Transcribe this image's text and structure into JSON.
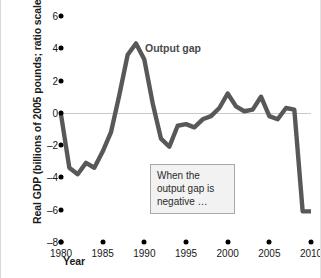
{
  "chart_data": {
    "type": "line",
    "title": "",
    "xlabel": "Year",
    "ylabel": "Real GDP (billions of 2005 pounds; ratio scale)",
    "xlim": [
      1980,
      2010
    ],
    "ylim": [
      -8,
      6
    ],
    "yticks": [
      6,
      4,
      2,
      0,
      -2,
      -4,
      -6,
      -8
    ],
    "ytick_labels": [
      "6",
      "4",
      "2",
      "0",
      "–2",
      "–4",
      "–6",
      "–8"
    ],
    "xticks": [
      1980,
      1985,
      1990,
      1995,
      2000,
      2005,
      2010
    ],
    "xtick_labels": [
      "1980",
      "1985",
      "1990",
      "1995",
      "2000",
      "2005",
      "2010"
    ],
    "grid": false,
    "zero_line": true,
    "legend_position": "inline-annotation",
    "series": [
      {
        "name": "Output gap",
        "color": "#58585a",
        "x": [
          1980,
          1981,
          1982,
          1983,
          1984,
          1985,
          1986,
          1987,
          1988,
          1989,
          1990,
          1991,
          1992,
          1993,
          1994,
          1995,
          1996,
          1997,
          1998,
          1999,
          2000,
          2001,
          2002,
          2003,
          2004,
          2005,
          2006,
          2007,
          2008,
          2009,
          2010
        ],
        "values": [
          -0.1,
          -3.4,
          -3.8,
          -3.1,
          -3.4,
          -2.4,
          -1.2,
          1.1,
          3.6,
          4.3,
          3.3,
          0.6,
          -1.6,
          -2.1,
          -0.8,
          -0.7,
          -0.9,
          -0.4,
          -0.2,
          0.3,
          1.2,
          0.4,
          0.1,
          0.2,
          1.0,
          -0.2,
          -0.4,
          0.3,
          0.2,
          -6.1,
          -6.1
        ]
      }
    ],
    "annotations": [
      {
        "name": "series-label",
        "text": "Output gap"
      },
      {
        "name": "callout",
        "text": "When the output gap is negative …"
      }
    ]
  },
  "axes": {
    "ylabel": "Real GDP (billions of 2005 pounds; ratio scale)",
    "xlabel": "Year"
  },
  "labels": {
    "series": "Output gap",
    "callout": "When the output gap is negative …"
  }
}
